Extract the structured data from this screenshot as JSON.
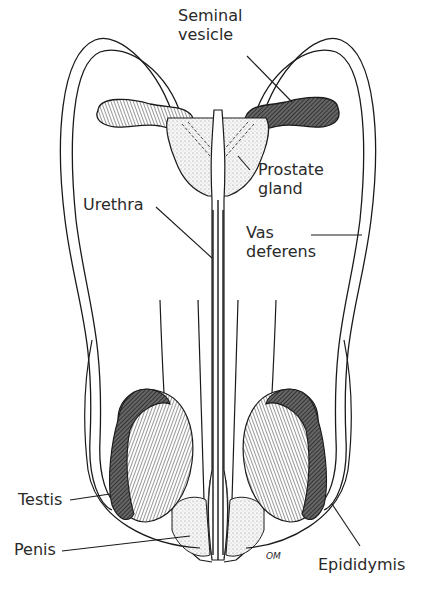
{
  "diagram": {
    "labels": {
      "seminal_vesicle": "Seminal\nvesicle",
      "prostate_gland": "Prostate\ngland",
      "urethra": "Urethra",
      "vas_deferens": "Vas\ndeferens",
      "testis": "Testis",
      "penis": "Penis",
      "epididymis": "Epididymis",
      "signature": "OM"
    },
    "colors": {
      "ink": "#1a1a1a",
      "text": "#2a2a2a",
      "background": "#ffffff",
      "stipple": "#f0f0f0"
    }
  }
}
